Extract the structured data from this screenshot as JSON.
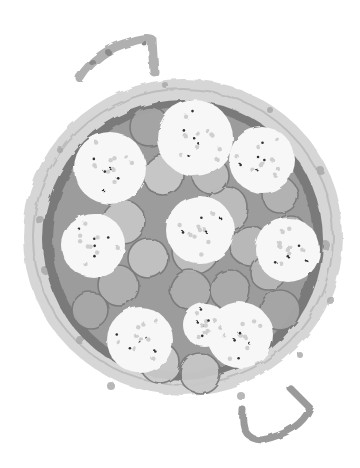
{
  "image": {
    "description": "Grayscale watercolor illustration of a paella pan viewed from above, with two handles, filled with round slices and white rice/cauliflower clusters",
    "width": 360,
    "height": 468
  },
  "colors": {
    "background": "#ffffff",
    "rim_light": "#d4d4d4",
    "rim_spot": "#a8a8a8",
    "inner_dark": "#6e6e6e",
    "slice_fill": "#b9b9b9",
    "slice_edge": "#7a7a7a",
    "cluster": "#f7f7f7",
    "speck": "#333333"
  },
  "pan": {
    "cx": 183,
    "cy": 237,
    "rx": 160,
    "ry": 158,
    "inner_rx": 140,
    "inner_ry": 140
  },
  "handles": [
    {
      "name": "top-left-handle",
      "path": "M80 78 Q110 40 150 38 L153 72"
    },
    {
      "name": "bottom-right-handle",
      "path": "M243 410 Q250 440 290 430 Q315 420 310 395"
    }
  ],
  "slices": [
    [
      150,
      127,
      20
    ],
    [
      163,
      175,
      20
    ],
    [
      123,
      222,
      22
    ],
    [
      148,
      258,
      20
    ],
    [
      195,
      250,
      24
    ],
    [
      226,
      208,
      22
    ],
    [
      250,
      246,
      20
    ],
    [
      268,
      272,
      18
    ],
    [
      280,
      195,
      18
    ],
    [
      118,
      285,
      20
    ],
    [
      190,
      290,
      20
    ],
    [
      230,
      290,
      20
    ],
    [
      90,
      310,
      18
    ],
    [
      280,
      310,
      20
    ],
    [
      160,
      363,
      20
    ],
    [
      200,
      373,
      20
    ],
    [
      240,
      345,
      20
    ],
    [
      100,
      250,
      18
    ],
    [
      210,
      175,
      18
    ],
    [
      250,
      160,
      16
    ],
    [
      130,
      330,
      16
    ],
    [
      290,
      230,
      15
    ]
  ],
  "clusters": [
    [
      110,
      168,
      36
    ],
    [
      195,
      138,
      38
    ],
    [
      262,
      160,
      33
    ],
    [
      200,
      230,
      34
    ],
    [
      93,
      245,
      32
    ],
    [
      288,
      250,
      32
    ],
    [
      140,
      340,
      33
    ],
    [
      240,
      335,
      33
    ],
    [
      205,
      325,
      22
    ]
  ]
}
